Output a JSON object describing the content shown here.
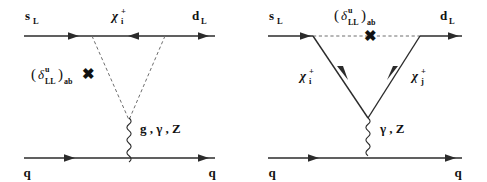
{
  "figure": {
    "background_color": "#ffffff",
    "line_color": "#2b2b2b",
    "dashed_color": "#6e6e6e"
  },
  "diagrams": [
    {
      "id": "left-diagram",
      "name": "box-penguin-diagram",
      "external_legs": {
        "in_upper": "s",
        "in_upper_sub": "L",
        "out_upper": "d",
        "out_upper_sub": "L",
        "in_lower": "q",
        "out_lower": "q"
      },
      "internal_line_label": {
        "symbol": "χ",
        "superscript": "+",
        "subscript": "i"
      },
      "mass_insertion": {
        "open_paren": "(",
        "symbol": "δ",
        "superscript": "u",
        "subscript": "LL",
        "close_paren": ")",
        "indices": "ab",
        "cross": "✖"
      },
      "boson_label": "g , γ , Z",
      "boson_type": "wavy",
      "squark_lines": "dashed"
    },
    {
      "id": "right-diagram",
      "name": "vertex-penguin-diagram",
      "external_legs": {
        "in_upper": "s",
        "in_upper_sub": "L",
        "out_upper": "d",
        "out_upper_sub": "L",
        "in_lower": "q",
        "out_lower": "q"
      },
      "internal_line_label_left": {
        "symbol": "χ",
        "superscript": "+",
        "subscript": "i"
      },
      "internal_line_label_right": {
        "symbol": "χ",
        "superscript": "+",
        "subscript": "j"
      },
      "mass_insertion": {
        "open_paren": "(",
        "symbol": "δ",
        "superscript": "u",
        "subscript": "LL",
        "close_paren": ")",
        "indices": "ab",
        "cross": "✖"
      },
      "boson_label": "γ , Z",
      "boson_type": "wavy",
      "squark_lines": "dashed"
    }
  ]
}
